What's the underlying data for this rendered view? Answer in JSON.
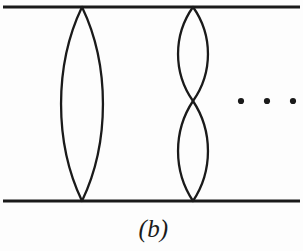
{
  "figure": {
    "caption": "(b)",
    "type": "line-diagram",
    "background_color": "#fdfdfd",
    "ink_color": "#1a1a1a",
    "canvas": {
      "width": 303,
      "height": 251
    }
  },
  "geometry": {
    "top_line": {
      "x1": 3,
      "y1": 7,
      "x2": 300,
      "y2": 7,
      "stroke_width": 3.2
    },
    "bottom_line": {
      "x1": 3,
      "y1": 201,
      "x2": 300,
      "y2": 201,
      "stroke_width": 3.2
    },
    "loops": [
      {
        "name": "large-single-loop",
        "cx": 82,
        "top_y": 7,
        "bottom_y": 201,
        "half_width": 21,
        "stroke_width": 2.3
      },
      {
        "name": "double-loop-upper",
        "cx": 193,
        "top_y": 7,
        "bottom_y": 101,
        "half_width": 15,
        "stroke_width": 2.3
      },
      {
        "name": "double-loop-lower",
        "cx": 193,
        "top_y": 101,
        "bottom_y": 201,
        "half_width": 15,
        "stroke_width": 2.3
      }
    ],
    "ellipsis_dots": [
      {
        "cx": 241,
        "cy": 101,
        "r": 3.1
      },
      {
        "cx": 267,
        "cy": 101,
        "r": 3.1
      },
      {
        "cx": 293,
        "cy": 101,
        "r": 3.1
      }
    ]
  },
  "colors": {
    "ink": "#1a1a1a",
    "background": "#fdfdfd",
    "caption": "#1b1b1b"
  }
}
